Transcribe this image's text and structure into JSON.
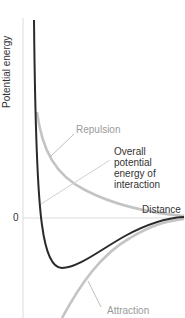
{
  "axes": {
    "y_label": "Potential energy",
    "x_label": "Distance",
    "zero_tick": "0"
  },
  "labels": {
    "repulsion": "Repulsion",
    "overall_line1": "Overall",
    "overall_line2": "potential",
    "overall_line3": "energy of",
    "overall_line4": "interaction",
    "attraction": "Attraction"
  },
  "colors": {
    "overall_curve": "#2a2a2a",
    "component_curves": "#c4c4c4",
    "axis": "#d8d8d8",
    "label_gray": "#9a9a9a",
    "label_dark": "#333333"
  }
}
